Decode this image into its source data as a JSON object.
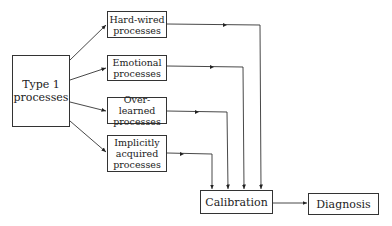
{
  "diagram": {
    "source": {
      "label": "Type 1\nprocesses"
    },
    "processes": [
      {
        "label": "Hard-wired\nprocesses"
      },
      {
        "label": "Emotional\nprocesses"
      },
      {
        "label": "Over-learned\nprocesses"
      },
      {
        "label": "Implicitly\nacquired\nprocesses"
      }
    ],
    "calibration": {
      "label": "Calibration"
    },
    "diagnosis": {
      "label": "Diagnosis"
    },
    "edges": [
      [
        "Type 1 processes",
        "Hard-wired processes"
      ],
      [
        "Type 1 processes",
        "Emotional processes"
      ],
      [
        "Type 1 processes",
        "Over-learned processes"
      ],
      [
        "Type 1 processes",
        "Implicitly acquired processes"
      ],
      [
        "Hard-wired processes",
        "Calibration"
      ],
      [
        "Emotional processes",
        "Calibration"
      ],
      [
        "Over-learned processes",
        "Calibration"
      ],
      [
        "Implicitly acquired processes",
        "Calibration"
      ],
      [
        "Calibration",
        "Diagnosis"
      ]
    ]
  }
}
